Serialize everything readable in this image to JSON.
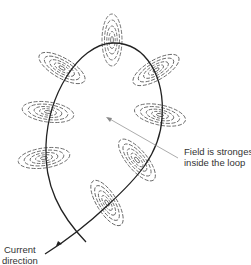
{
  "diagram": {
    "labels": {
      "field_line1": "Field is strongest",
      "field_line2": "inside the loop",
      "current_line1": "Current",
      "current_line2": "direction"
    },
    "colors": {
      "line": "#222222",
      "field": "#555555",
      "pointer": "#888888"
    }
  }
}
